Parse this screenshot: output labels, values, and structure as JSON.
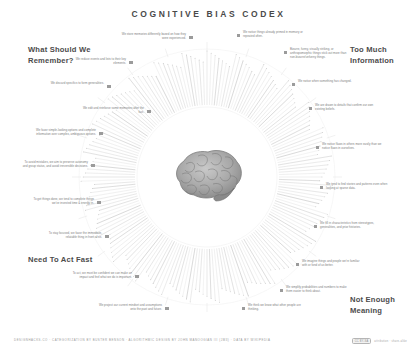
{
  "header": {
    "title": "COGNITIVE BIAS CODEX"
  },
  "quadrants": [
    {
      "id": "what-should-we-remember",
      "label": "What Should We Remember?"
    },
    {
      "id": "too-much-information",
      "label": "Too Much Information"
    },
    {
      "id": "need-to-act-fast",
      "label": "Need To Act Fast"
    },
    {
      "id": "not-enough-meaning",
      "label": "Not Enough Meaning"
    }
  ],
  "group_labels": [
    {
      "text": "We store memories differently based on how they were experienced.",
      "x": 120,
      "y": 33,
      "align": "r",
      "width": 66
    },
    {
      "text": "We notice things already primed in memory or repeated often.",
      "x": 243,
      "y": 31,
      "align": "l",
      "width": 66
    },
    {
      "text": "We reduce events and lists to their key elements.",
      "x": 66,
      "y": 58,
      "align": "r",
      "width": 60
    },
    {
      "text": "Bizarre, funny, visually striking, or anthropomorphic things stick out more than non-bizarre/unfunny things.",
      "x": 290,
      "y": 48,
      "align": "l",
      "width": 62
    },
    {
      "text": "We discard specifics to form generalities.",
      "x": 46,
      "y": 82,
      "align": "r",
      "width": 58
    },
    {
      "text": "We notice when something has changed.",
      "x": 298,
      "y": 80,
      "align": "l",
      "width": 58
    },
    {
      "text": "We edit and reinforce some memories after the fact.",
      "x": 82,
      "y": 107,
      "align": "r",
      "width": 62
    },
    {
      "text": "We are drawn to details that confirm our own existing beliefs.",
      "x": 315,
      "y": 104,
      "align": "l",
      "width": 62
    },
    {
      "text": "We favor simple-looking options and complete information over complex, ambiguous options.",
      "x": 30,
      "y": 129,
      "align": "r",
      "width": 66
    },
    {
      "text": "We notice flaws in others more easily than we notice flaws in ourselves.",
      "x": 322,
      "y": 143,
      "align": "l",
      "width": 62
    },
    {
      "text": "To avoid mistakes, we aim to preserve autonomy and group status, and avoid irreversible decisions.",
      "x": 22,
      "y": 161,
      "align": "r",
      "width": 66
    },
    {
      "text": "We tend to find stories and patterns even when looking at sparse data.",
      "x": 326,
      "y": 183,
      "align": "l",
      "width": 62
    },
    {
      "text": "To get things done, we tend to complete things we've invested time & energy in.",
      "x": 28,
      "y": 198,
      "align": "r",
      "width": 66
    },
    {
      "text": "We fill in characteristics from stereotypes, generalities, and prior histories.",
      "x": 320,
      "y": 222,
      "align": "l",
      "width": 62
    },
    {
      "text": "To stay focused, we favor the immediate, relatable thing in front of us.",
      "x": 38,
      "y": 232,
      "align": "r",
      "width": 64
    },
    {
      "text": "We imagine things and people we're familiar with or fond of as better.",
      "x": 302,
      "y": 260,
      "align": "l",
      "width": 62
    },
    {
      "text": "To act, we must be confident we can make an impact and feel what we do is important.",
      "x": 66,
      "y": 272,
      "align": "r",
      "width": 66
    },
    {
      "text": "We simplify probabilities and numbers to make them easier to think about.",
      "x": 286,
      "y": 286,
      "align": "l",
      "width": 62
    },
    {
      "text": "We project our current mindset and assumptions onto the past and future.",
      "x": 96,
      "y": 304,
      "align": "r",
      "width": 66
    },
    {
      "text": "We think we know what other people are thinking.",
      "x": 248,
      "y": 304,
      "align": "l",
      "width": 60
    }
  ],
  "footer": {
    "credits": "DESIGNHACKS.CO · CATEGORIZATION BY BUSTER BENSON · ALGORITHMIC DESIGN BY JOHN MANOOGIAN III (JM3) · DATA BY WIKIPEDIA",
    "license_badge": "CC BY-SA",
    "license_note": "attribution · share-alike"
  },
  "colors": {
    "background": "#ffffff",
    "title": "#4a4a4a",
    "heading": "#4c4c4c",
    "label": "#7e7e7e",
    "bullet": "#9b9b9b",
    "ray": "#c9c9c9"
  },
  "center": {
    "icon": "brain-illustration"
  }
}
